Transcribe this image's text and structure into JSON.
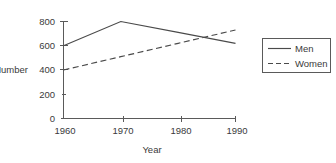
{
  "chart_data": {
    "type": "line",
    "title": "",
    "xlabel": "Year",
    "ylabel": "Number",
    "x": [
      1960,
      1970,
      1980,
      1990
    ],
    "xtick_labels": [
      "1960",
      "1970",
      "1980",
      "1990"
    ],
    "ytick_labels": [
      "0",
      "200",
      "400",
      "600",
      "800"
    ],
    "yticks": [
      0,
      200,
      400,
      600,
      800
    ],
    "ylim": [
      0,
      800
    ],
    "xlim": [
      1960,
      1990
    ],
    "grid": false,
    "legend_position": "right",
    "series": [
      {
        "name": "Men",
        "style": "solid",
        "color": "#4a4a4a",
        "values": [
          600,
          800,
          710,
          620
        ]
      },
      {
        "name": "Women",
        "style": "dashed",
        "color": "#4a4a4a",
        "values": [
          400,
          510,
          620,
          730
        ]
      }
    ]
  },
  "axes": {
    "y_label": "Number",
    "x_label": "Year",
    "y_ticks": [
      {
        "label": "800",
        "value": 800
      },
      {
        "label": "600",
        "value": 600
      },
      {
        "label": "400",
        "value": 400
      },
      {
        "label": "200",
        "value": 200
      },
      {
        "label": "0",
        "value": 0
      }
    ],
    "x_ticks": [
      {
        "label": "1960",
        "value": 1960
      },
      {
        "label": "1970",
        "value": 1970
      },
      {
        "label": "1980",
        "value": 1980
      },
      {
        "label": "1990",
        "value": 1990
      }
    ]
  },
  "legend": {
    "entries": [
      {
        "label": "Men",
        "style": "solid"
      },
      {
        "label": "Women",
        "style": "dashed"
      }
    ]
  }
}
